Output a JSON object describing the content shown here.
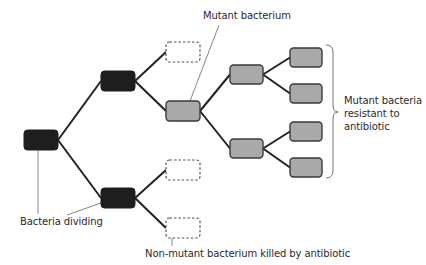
{
  "diagram": {
    "type": "bacterial-division-tree",
    "colors": {
      "dividing_fill": "#1e1e1e",
      "mutant_fill": "#a9a9a9",
      "mutant_stroke": "#3a3a3a",
      "killed_stroke": "#555555",
      "branch_line": "#222222",
      "leader_line": "#777777",
      "text": "#2a2a2a"
    },
    "nodes": [
      {
        "id": "root",
        "kind": "dividing",
        "x": 24,
        "y": 130,
        "w": 34,
        "h": 20
      },
      {
        "id": "div-top",
        "kind": "dividing",
        "x": 101,
        "y": 71,
        "w": 34,
        "h": 20
      },
      {
        "id": "div-bottom",
        "kind": "dividing",
        "x": 101,
        "y": 188,
        "w": 34,
        "h": 20
      },
      {
        "id": "killed-1",
        "kind": "killed",
        "x": 166,
        "y": 42,
        "w": 34,
        "h": 20
      },
      {
        "id": "mutant",
        "kind": "mutant",
        "x": 166,
        "y": 101,
        "w": 34,
        "h": 20
      },
      {
        "id": "killed-2",
        "kind": "killed",
        "x": 166,
        "y": 160,
        "w": 34,
        "h": 20
      },
      {
        "id": "killed-3",
        "kind": "killed",
        "x": 166,
        "y": 218,
        "w": 34,
        "h": 20
      },
      {
        "id": "mutant-a",
        "kind": "mutant",
        "x": 230,
        "y": 65,
        "w": 33,
        "h": 19
      },
      {
        "id": "mutant-b",
        "kind": "mutant",
        "x": 230,
        "y": 139,
        "w": 33,
        "h": 19
      },
      {
        "id": "leaf-1",
        "kind": "mutant",
        "x": 290,
        "y": 48,
        "w": 32,
        "h": 19
      },
      {
        "id": "leaf-2",
        "kind": "mutant",
        "x": 290,
        "y": 84,
        "w": 32,
        "h": 19
      },
      {
        "id": "leaf-3",
        "kind": "mutant",
        "x": 290,
        "y": 122,
        "w": 32,
        "h": 19
      },
      {
        "id": "leaf-4",
        "kind": "mutant",
        "x": 290,
        "y": 158,
        "w": 32,
        "h": 19
      }
    ],
    "edges": [
      [
        "root",
        "div-top"
      ],
      [
        "root",
        "div-bottom"
      ],
      [
        "div-top",
        "killed-1"
      ],
      [
        "div-top",
        "mutant"
      ],
      [
        "div-bottom",
        "killed-2"
      ],
      [
        "div-bottom",
        "killed-3"
      ],
      [
        "mutant",
        "mutant-a"
      ],
      [
        "mutant",
        "mutant-b"
      ],
      [
        "mutant-a",
        "leaf-1"
      ],
      [
        "mutant-a",
        "leaf-2"
      ],
      [
        "mutant-b",
        "leaf-3"
      ],
      [
        "mutant-b",
        "leaf-4"
      ]
    ],
    "labels": {
      "mutant_bacterium": "Mutant bacterium",
      "bacteria_dividing": "Bacteria dividing",
      "non_mutant_killed": "Non-mutant bacterium killed by antibiotic",
      "resistant_line1": "Mutant bacteria",
      "resistant_line2": "resistant to",
      "resistant_line3": "antibiotic"
    }
  }
}
